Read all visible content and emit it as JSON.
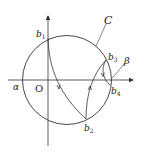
{
  "diagram": {
    "circle_label": "C",
    "origin_label": "O",
    "alpha_label": "α",
    "beta_label": "β",
    "points": [
      {
        "base": "b",
        "sub": "1"
      },
      {
        "base": "b",
        "sub": "2"
      },
      {
        "base": "b",
        "sub": "3"
      },
      {
        "base": "b",
        "sub": "4"
      }
    ],
    "colors": {
      "stroke": "#333333",
      "background": "#ffffff"
    }
  }
}
